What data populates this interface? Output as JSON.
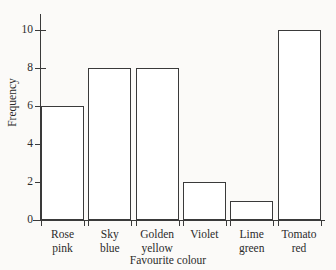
{
  "chart_data": {
    "type": "bar",
    "title": "",
    "xlabel": "Favourite colour",
    "ylabel": "Frequency",
    "categories": [
      "Rose\npink",
      "Sky\nblue",
      "Golden\nyellow",
      "Violet",
      "Lime\ngreen",
      "Tomato\nred"
    ],
    "values": [
      6,
      8,
      8,
      2,
      1,
      10
    ],
    "ylim": [
      0,
      11
    ],
    "yticks": [
      0,
      2,
      4,
      6,
      8,
      10
    ],
    "ytick_labels": [
      "0",
      "2",
      "4",
      "6",
      "8",
      "10"
    ],
    "grid": false,
    "legend": false,
    "bar_fill_color": "#ffffff",
    "bar_edge_color": "#3a3a3a",
    "background_color": "#fbfaf8"
  }
}
